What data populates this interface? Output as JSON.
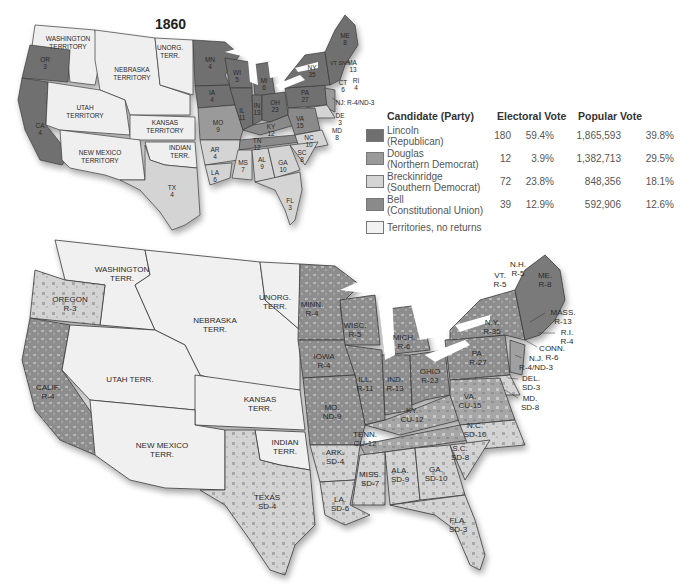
{
  "title": "1860",
  "colors": {
    "republican": "#6f6f6f",
    "northern_democrat": "#9a9a9a",
    "southern_democrat": "#d0d0d0",
    "constitutional_union": "#8a8a8a",
    "territory": "#efefef",
    "lake": "#ffffff",
    "border": "#3a3a3a"
  },
  "legend": {
    "headers": {
      "candidate": "Candidate (Party)",
      "electoral": "Electoral Vote",
      "popular": "Popular Vote"
    },
    "rows": [
      {
        "name": "Lincoln",
        "party": "(Republican)",
        "ev": "180",
        "ev_pct": "59.4%",
        "pv": "1,865,593",
        "pv_pct": "39.8%",
        "color": "#6f6f6f"
      },
      {
        "name": "Douglas",
        "party": "(Northern Democrat)",
        "ev": "12",
        "ev_pct": "3.9%",
        "pv": "1,382,713",
        "pv_pct": "29.5%",
        "color": "#9a9a9a"
      },
      {
        "name": "Breckinridge",
        "party": "(Southern Democrat)",
        "ev": "72",
        "ev_pct": "23.8%",
        "pv": "848,356",
        "pv_pct": "18.1%",
        "color": "#d4d4d4"
      },
      {
        "name": "Bell",
        "party": "(Constitutional Union)",
        "ev": "39",
        "ev_pct": "12.9%",
        "pv": "592,906",
        "pv_pct": "12.6%",
        "color": "#8a8a8a"
      },
      {
        "name": "Territories, no returns",
        "party": "",
        "ev": "",
        "ev_pct": "",
        "pv": "",
        "pv_pct": "",
        "color": "#f2f2f2"
      }
    ]
  },
  "top_map": {
    "territories": {
      "washington": [
        "WASHINGTON",
        "TERRITORY"
      ],
      "nebraska": [
        "NEBRASKA",
        "TERRITORY"
      ],
      "unorg": [
        "UNORG.",
        "TERR."
      ],
      "utah": [
        "UTAH",
        "TERRITORY"
      ],
      "kansas": [
        "KANSAS",
        "TERRITORY"
      ],
      "new_mexico": [
        "NEW MEXICO",
        "TERRITORY"
      ],
      "indian": [
        "INDIAN",
        "TERR."
      ]
    },
    "states": [
      {
        "abbr": "OR",
        "ev": "3"
      },
      {
        "abbr": "CA",
        "ev": "4"
      },
      {
        "abbr": "MN",
        "ev": "4"
      },
      {
        "abbr": "WI",
        "ev": "5"
      },
      {
        "abbr": "MI",
        "ev": "6"
      },
      {
        "abbr": "IA",
        "ev": "4"
      },
      {
        "abbr": "IL",
        "ev": "11"
      },
      {
        "abbr": "IN",
        "ev": "13"
      },
      {
        "abbr": "OH",
        "ev": "23"
      },
      {
        "abbr": "PA",
        "ev": "27"
      },
      {
        "abbr": "NY",
        "ev": "35"
      },
      {
        "abbr": "VT",
        "ev": "5"
      },
      {
        "abbr": "NH",
        "ev": "5"
      },
      {
        "abbr": "ME",
        "ev": "8"
      },
      {
        "abbr": "MA",
        "ev": "13"
      },
      {
        "abbr": "RI",
        "ev": "4"
      },
      {
        "abbr": "CT",
        "ev": "6"
      },
      {
        "abbr": "NJ",
        "ev": "R-4/ND-3"
      },
      {
        "abbr": "DE",
        "ev": "3"
      },
      {
        "abbr": "MD",
        "ev": "8"
      },
      {
        "abbr": "MO",
        "ev": "9"
      },
      {
        "abbr": "KY",
        "ev": "12"
      },
      {
        "abbr": "VA",
        "ev": "15"
      },
      {
        "abbr": "TN",
        "ev": "12"
      },
      {
        "abbr": "NC",
        "ev": "10"
      },
      {
        "abbr": "SC",
        "ev": "8"
      },
      {
        "abbr": "GA",
        "ev": "10"
      },
      {
        "abbr": "AL",
        "ev": "9"
      },
      {
        "abbr": "MS",
        "ev": "7"
      },
      {
        "abbr": "LA",
        "ev": "6"
      },
      {
        "abbr": "AR",
        "ev": "4"
      },
      {
        "abbr": "TX",
        "ev": "4"
      },
      {
        "abbr": "FL",
        "ev": "3"
      }
    ],
    "nj_label": "NJ: R-4/ND-3"
  },
  "bottom_map": {
    "territories": {
      "washington": [
        "WASHINGTON",
        "TERR."
      ],
      "nebraska": [
        "NEBRASKA",
        "TERR."
      ],
      "unorg": [
        "UNORG.",
        "TERR."
      ],
      "utah": [
        "UTAH TERR."
      ],
      "kansas": [
        "KANSAS",
        "TERR."
      ],
      "new_mexico": [
        "NEW MEXICO",
        "TERR."
      ],
      "indian": [
        "INDIAN",
        "TERR."
      ]
    },
    "states": [
      {
        "name": "OREGON",
        "result": "R-3"
      },
      {
        "name": "CALIF.",
        "result": "R-4"
      },
      {
        "name": "MINN.",
        "result": "R-4"
      },
      {
        "name": "WISC.",
        "result": "R-5"
      },
      {
        "name": "MICH.",
        "result": "R-6"
      },
      {
        "name": "IOWA",
        "result": "R-4"
      },
      {
        "name": "ILL.",
        "result": "R-11"
      },
      {
        "name": "IND.",
        "result": "R-13"
      },
      {
        "name": "OHIO",
        "result": "R-23"
      },
      {
        "name": "PA.",
        "result": "R-27"
      },
      {
        "name": "N.Y.",
        "result": "R-35"
      },
      {
        "name": "VT.",
        "result": "R-5"
      },
      {
        "name": "N.H.",
        "result": "R-5"
      },
      {
        "name": "ME.",
        "result": "R-8"
      },
      {
        "name": "MASS.",
        "result": "R-13"
      },
      {
        "name": "R.I.",
        "result": "R-4"
      },
      {
        "name": "CONN.",
        "result": "R-6"
      },
      {
        "name": "N.J.",
        "result": "R-4/ND-3"
      },
      {
        "name": "DEL.",
        "result": "SD-3"
      },
      {
        "name": "MD.",
        "result": "SD-8"
      },
      {
        "name": "MO.",
        "result": "ND-9"
      },
      {
        "name": "KY.",
        "result": "CU-12"
      },
      {
        "name": "VA.",
        "result": "CU-15"
      },
      {
        "name": "TENN.",
        "result": "CU-12"
      },
      {
        "name": "N.C.",
        "result": "SD-10"
      },
      {
        "name": "S.C.",
        "result": "SD-8"
      },
      {
        "name": "GA.",
        "result": "SD-10"
      },
      {
        "name": "ALA.",
        "result": "SD-9"
      },
      {
        "name": "MISS.",
        "result": "SD-7"
      },
      {
        "name": "LA.",
        "result": "SD-6"
      },
      {
        "name": "ARK.",
        "result": "SD-4"
      },
      {
        "name": "TEXAS",
        "result": "SD-4"
      },
      {
        "name": "FLA.",
        "result": "SD-3"
      }
    ]
  }
}
